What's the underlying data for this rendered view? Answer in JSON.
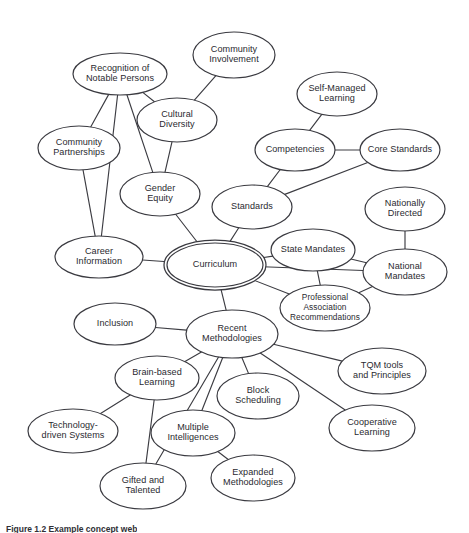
{
  "figure": {
    "caption": "Figure 1.2   Example concept web",
    "background_color": "#ffffff",
    "line_color": "#3c3c42",
    "text_color": "#2a2a30"
  },
  "chart_data": {
    "type": "diagram",
    "diagram_type": "concept-web",
    "title": "Example concept web",
    "center_node": "Curriculum",
    "nodes": [
      {
        "id": "curriculum",
        "label": "Curriculum",
        "cx": 215,
        "cy": 265,
        "rx": 48,
        "ry": 22,
        "double": true,
        "lines": [
          "Curriculum"
        ]
      },
      {
        "id": "recognition",
        "label": "Recognition of Notable Persons",
        "cx": 120,
        "cy": 74,
        "rx": 47,
        "ry": 21,
        "double": false,
        "lines": [
          "Recognition of",
          "Notable Persons"
        ]
      },
      {
        "id": "community-involvement",
        "label": "Community Involvement",
        "cx": 234,
        "cy": 55,
        "rx": 41,
        "ry": 23,
        "double": false,
        "lines": [
          "Community",
          "Involvement"
        ]
      },
      {
        "id": "cultural-diversity",
        "label": "Cultural Diversity",
        "cx": 177,
        "cy": 120,
        "rx": 40,
        "ry": 22,
        "double": false,
        "lines": [
          "Cultural",
          "Diversity"
        ]
      },
      {
        "id": "community-partnerships",
        "label": "Community Partnerships",
        "cx": 79,
        "cy": 148,
        "rx": 41,
        "ry": 22,
        "double": false,
        "lines": [
          "Community",
          "Partnerships"
        ]
      },
      {
        "id": "gender-equity",
        "label": "Gender Equity",
        "cx": 160,
        "cy": 194,
        "rx": 40,
        "ry": 22,
        "double": false,
        "lines": [
          "Gender",
          "Equity"
        ]
      },
      {
        "id": "career-information",
        "label": "Career Information",
        "cx": 99,
        "cy": 257,
        "rx": 44,
        "ry": 21,
        "double": false,
        "lines": [
          "Career",
          "Information"
        ]
      },
      {
        "id": "self-managed-learning",
        "label": "Self-Managed Learning",
        "cx": 337,
        "cy": 94,
        "rx": 40,
        "ry": 22,
        "double": false,
        "lines": [
          "Self-Managed",
          "Learning"
        ]
      },
      {
        "id": "competencies",
        "label": "Competencies",
        "cx": 295,
        "cy": 150,
        "rx": 40,
        "ry": 21,
        "double": false,
        "lines": [
          "Competencies"
        ]
      },
      {
        "id": "core-standards",
        "label": "Core Standards",
        "cx": 400,
        "cy": 150,
        "rx": 40,
        "ry": 21,
        "double": false,
        "lines": [
          "Core Standards"
        ]
      },
      {
        "id": "standards",
        "label": "Standards",
        "cx": 252,
        "cy": 207,
        "rx": 40,
        "ry": 22,
        "double": false,
        "lines": [
          "Standards"
        ]
      },
      {
        "id": "state-mandates",
        "label": "State Mandates",
        "cx": 313,
        "cy": 250,
        "rx": 42,
        "ry": 21,
        "double": false,
        "lines": [
          "State Mandates"
        ]
      },
      {
        "id": "nationally-directed",
        "label": "Nationally Directed",
        "cx": 405,
        "cy": 209,
        "rx": 40,
        "ry": 22,
        "double": false,
        "lines": [
          "Nationally",
          "Directed"
        ]
      },
      {
        "id": "national-mandates",
        "label": "National Mandates",
        "cx": 405,
        "cy": 272,
        "rx": 42,
        "ry": 23,
        "double": false,
        "lines": [
          "National",
          "Mandates"
        ]
      },
      {
        "id": "professional-association",
        "label": "Professional Association Recommendations",
        "cx": 325,
        "cy": 308,
        "rx": 45,
        "ry": 23,
        "double": false,
        "lines": [
          "Professional",
          "Association",
          "Recommendations"
        ]
      },
      {
        "id": "recent-methodologies",
        "label": "Recent Methodologies",
        "cx": 232,
        "cy": 334,
        "rx": 46,
        "ry": 24,
        "double": false,
        "lines": [
          "Recent",
          "Methodologies"
        ]
      },
      {
        "id": "inclusion",
        "label": "Inclusion",
        "cx": 115,
        "cy": 324,
        "rx": 41,
        "ry": 21,
        "double": false,
        "lines": [
          "Inclusion"
        ]
      },
      {
        "id": "brain-based-learning",
        "label": "Brain-based Learning",
        "cx": 157,
        "cy": 378,
        "rx": 42,
        "ry": 22,
        "double": false,
        "lines": [
          "Brain-based",
          "Learning"
        ]
      },
      {
        "id": "block-scheduling",
        "label": "Block Scheduling",
        "cx": 258,
        "cy": 396,
        "rx": 41,
        "ry": 23,
        "double": false,
        "lines": [
          "Block",
          "Scheduling"
        ]
      },
      {
        "id": "tqm-tools",
        "label": "TQM tools and Principles",
        "cx": 382,
        "cy": 371,
        "rx": 44,
        "ry": 23,
        "double": false,
        "lines": [
          "TQM tools",
          "and Principles"
        ]
      },
      {
        "id": "technology-driven-systems",
        "label": "Technology-driven Systems",
        "cx": 73,
        "cy": 431,
        "rx": 45,
        "ry": 22,
        "double": false,
        "lines": [
          "Technology-",
          "driven Systems"
        ]
      },
      {
        "id": "multiple-intelligences",
        "label": "Multiple Intelligences",
        "cx": 193,
        "cy": 433,
        "rx": 42,
        "ry": 23,
        "double": false,
        "lines": [
          "Multiple",
          "Intelligences"
        ]
      },
      {
        "id": "cooperative-learning",
        "label": "Cooperative Learning",
        "cx": 372,
        "cy": 428,
        "rx": 43,
        "ry": 23,
        "double": false,
        "lines": [
          "Cooperative",
          "Learning"
        ]
      },
      {
        "id": "gifted-and-talented",
        "label": "Gifted and Talented",
        "cx": 143,
        "cy": 486,
        "rx": 43,
        "ry": 23,
        "double": false,
        "lines": [
          "Gifted and",
          "Talented"
        ]
      },
      {
        "id": "expanded-methodologies",
        "label": "Expanded Methodologies",
        "cx": 253,
        "cy": 478,
        "rx": 42,
        "ry": 23,
        "double": false,
        "lines": [
          "Expanded",
          "Methodologies"
        ]
      }
    ],
    "edges": [
      {
        "from": "curriculum",
        "to": "career-information"
      },
      {
        "from": "curriculum",
        "to": "gender-equity"
      },
      {
        "from": "curriculum",
        "to": "standards"
      },
      {
        "from": "curriculum",
        "to": "state-mandates"
      },
      {
        "from": "curriculum",
        "to": "national-mandates"
      },
      {
        "from": "curriculum",
        "to": "professional-association"
      },
      {
        "from": "curriculum",
        "to": "recent-methodologies"
      },
      {
        "from": "recognition",
        "to": "community-partnerships"
      },
      {
        "from": "recognition",
        "to": "career-information"
      },
      {
        "from": "recognition",
        "to": "gender-equity"
      },
      {
        "from": "recognition",
        "to": "cultural-diversity"
      },
      {
        "from": "community-involvement",
        "to": "cultural-diversity"
      },
      {
        "from": "cultural-diversity",
        "to": "gender-equity"
      },
      {
        "from": "community-partnerships",
        "to": "career-information"
      },
      {
        "from": "self-managed-learning",
        "to": "competencies"
      },
      {
        "from": "competencies",
        "to": "core-standards"
      },
      {
        "from": "competencies",
        "to": "standards"
      },
      {
        "from": "core-standards",
        "to": "standards"
      },
      {
        "from": "state-mandates",
        "to": "national-mandates"
      },
      {
        "from": "state-mandates",
        "to": "professional-association"
      },
      {
        "from": "nationally-directed",
        "to": "national-mandates"
      },
      {
        "from": "national-mandates",
        "to": "professional-association"
      },
      {
        "from": "recent-methodologies",
        "to": "inclusion"
      },
      {
        "from": "recent-methodologies",
        "to": "brain-based-learning"
      },
      {
        "from": "recent-methodologies",
        "to": "multiple-intelligences"
      },
      {
        "from": "recent-methodologies",
        "to": "block-scheduling"
      },
      {
        "from": "recent-methodologies",
        "to": "tqm-tools"
      },
      {
        "from": "recent-methodologies",
        "to": "cooperative-learning"
      },
      {
        "from": "recent-methodologies",
        "to": "gifted-and-talented"
      },
      {
        "from": "brain-based-learning",
        "to": "technology-driven-systems"
      },
      {
        "from": "brain-based-learning",
        "to": "gifted-and-talented"
      },
      {
        "from": "multiple-intelligences",
        "to": "expanded-methodologies"
      }
    ]
  }
}
